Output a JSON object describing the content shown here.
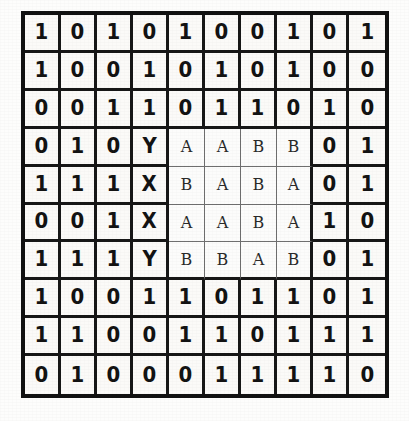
{
  "figure": {
    "rows": 10,
    "columns": 10,
    "ink_color": "#131313",
    "paper_color": "#fbfaf8",
    "rule_color": "#171717",
    "inner_rule_color": "#6f6f6f"
  },
  "grid": {
    "cells": [
      [
        "1",
        "0",
        "1",
        "0",
        "1",
        "0",
        "0",
        "1",
        "0",
        "1"
      ],
      [
        "1",
        "0",
        "0",
        "1",
        "0",
        "1",
        "0",
        "1",
        "0",
        "0"
      ],
      [
        "0",
        "0",
        "1",
        "1",
        "0",
        "1",
        "1",
        "0",
        "1",
        "0"
      ],
      [
        "0",
        "1",
        "0",
        "Y",
        "A",
        "A",
        "B",
        "B",
        "0",
        "1"
      ],
      [
        "1",
        "1",
        "1",
        "X",
        "B",
        "A",
        "B",
        "A",
        "0",
        "1"
      ],
      [
        "0",
        "0",
        "1",
        "X",
        "A",
        "A",
        "B",
        "A",
        "1",
        "0"
      ],
      [
        "1",
        "1",
        "1",
        "Y",
        "B",
        "B",
        "A",
        "B",
        "0",
        "1"
      ],
      [
        "1",
        "0",
        "0",
        "1",
        "1",
        "0",
        "1",
        "1",
        "0",
        "1"
      ],
      [
        "1",
        "1",
        "0",
        "0",
        "1",
        "1",
        "0",
        "1",
        "1",
        "1"
      ],
      [
        "0",
        "1",
        "0",
        "0",
        "0",
        "1",
        "1",
        "1",
        "1",
        "0"
      ]
    ],
    "letter_block": {
      "row_start": 3,
      "row_end": 6,
      "col_start": 4,
      "col_end": 7,
      "values": [
        [
          "A",
          "A",
          "B",
          "B"
        ],
        [
          "B",
          "A",
          "B",
          "A"
        ],
        [
          "A",
          "A",
          "B",
          "A"
        ],
        [
          "B",
          "B",
          "A",
          "B"
        ]
      ]
    },
    "marker_column": {
      "column_index": 3,
      "values": [
        "Y",
        "X",
        "X",
        "Y"
      ],
      "row_start": 3,
      "row_end": 6
    }
  }
}
